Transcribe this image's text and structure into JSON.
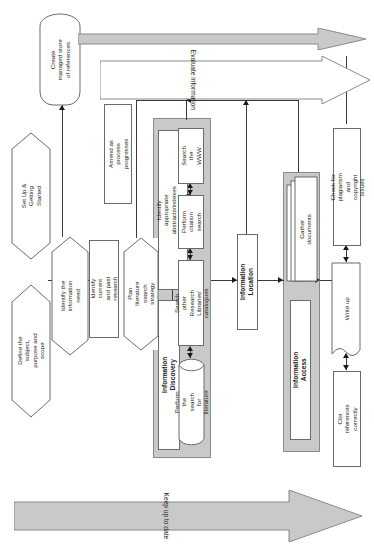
{
  "diagram": {
    "orientation": "rotated-90",
    "colors": {
      "group_fill": "#c9c9c9",
      "node_fill": "#ffffff",
      "stroke": "#6b6b6b",
      "arrow": "#1a1a1a",
      "banner_fill": "#c9c9c9"
    }
  },
  "stages": {
    "setup": {
      "label": "Set Up & Getting\nStarted"
    },
    "discovery": {
      "label": "Information Discovery"
    },
    "location": {
      "label": "Information Location"
    },
    "access": {
      "label": "Information Access"
    }
  },
  "nodes": {
    "define_subject": {
      "label": "Define the subject,\npurpose and scope",
      "shape": "hexagon"
    },
    "identify_need": {
      "label": "Identify the\ninformation need",
      "shape": "hexagon"
    },
    "identify_research": {
      "label": "Identify current and past\nresearch",
      "shape": "rect"
    },
    "plan_strategy": {
      "label": "Plan literature\nsearch strategy",
      "shape": "hexagon"
    },
    "amend_process": {
      "label": "Amend as process\nprogresses",
      "shape": "rect"
    },
    "create_store": {
      "label": "Create\nmanaged store\nof references",
      "shape": "terminator"
    },
    "identify_abstracts": {
      "label": "Identify appropriate abstracts/indexes\n(databases and/or print)",
      "shape": "rect"
    },
    "search_www": {
      "label": "Search the\nWWW",
      "shape": "rect"
    },
    "citation_search": {
      "label": "Perform\ncitation\nsearch",
      "shape": "rect"
    },
    "search_catalogues": {
      "label": "Search other Research\nLibraries' catalogues",
      "shape": "rect"
    },
    "perform_search": {
      "label": "Perform the search\nfor literature",
      "shape": "cylinder"
    },
    "gather_documents": {
      "label": "Gather documents",
      "shape": "document-stack"
    },
    "write_up": {
      "label": "Write up",
      "shape": "document"
    },
    "check_plagiarism": {
      "label": "Check for plagiarism\nand copyright issues",
      "shape": "rect"
    },
    "cite_references": {
      "label": "Cite references\ncorrectly",
      "shape": "rect"
    }
  },
  "banners": {
    "evaluate": {
      "label": "Evaluate information",
      "style": "outline-arrow"
    },
    "keep_up_to_date": {
      "label": "Keep up to date",
      "style": "filled-arrow"
    },
    "references_flow": {
      "label": "",
      "style": "filled-thin-arrow"
    }
  }
}
